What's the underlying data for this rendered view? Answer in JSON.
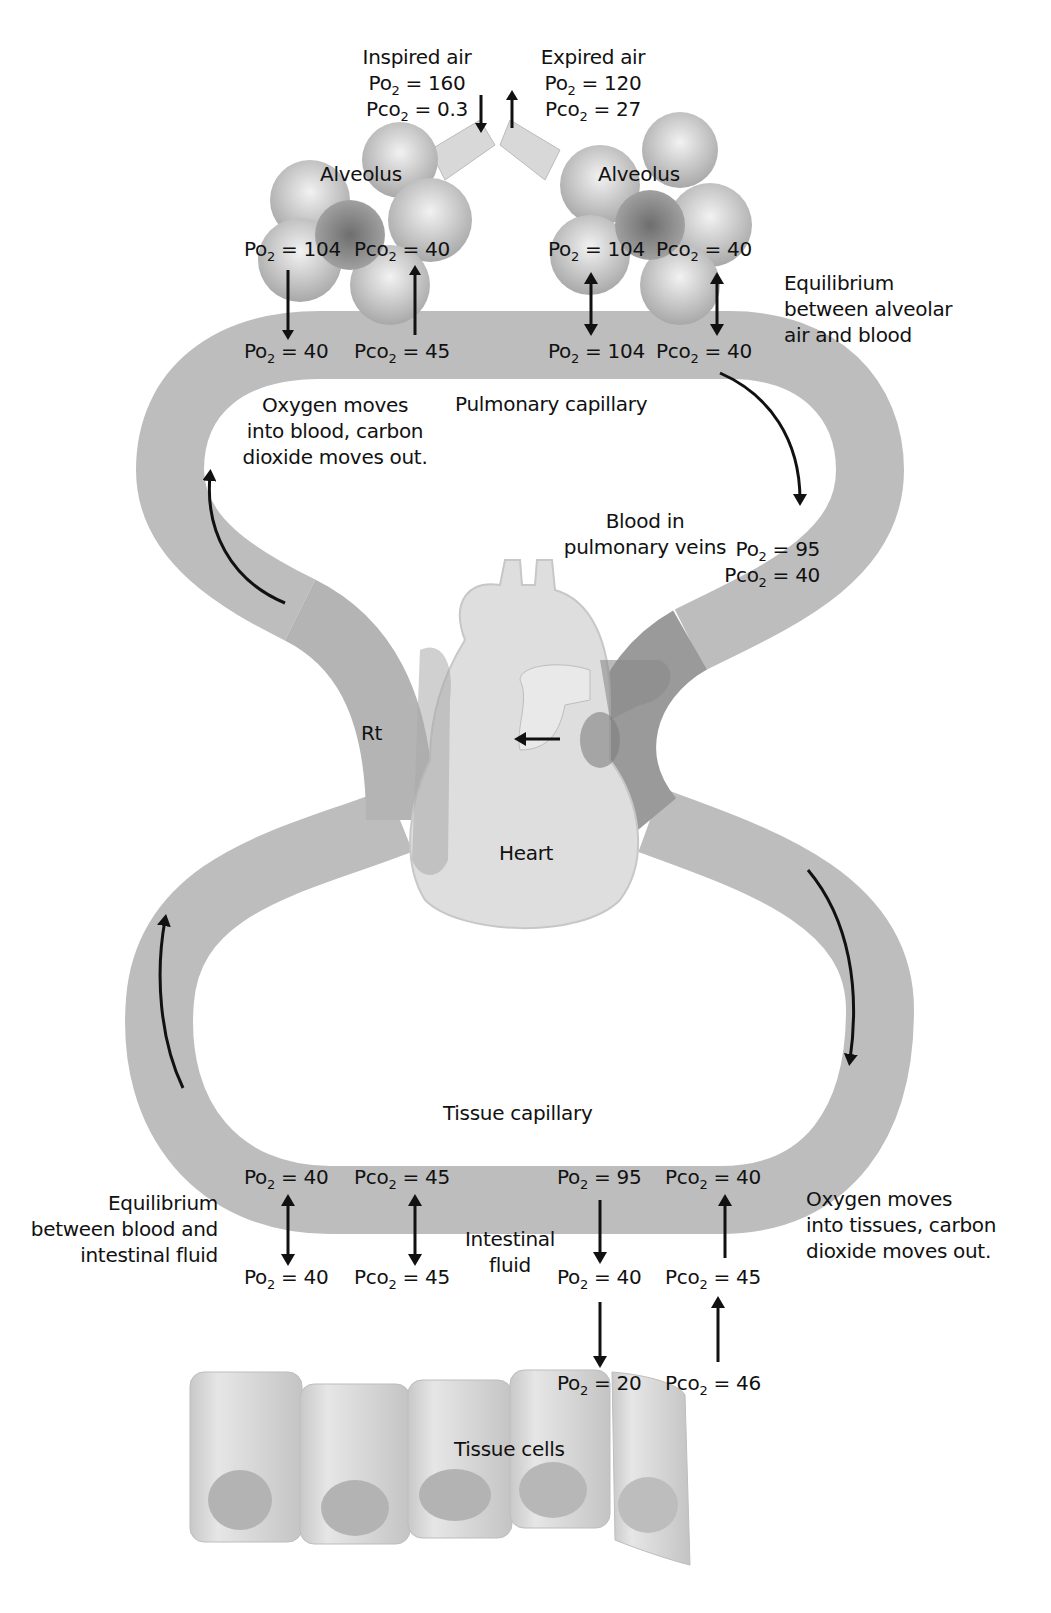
{
  "diagram": {
    "title": "",
    "colors": {
      "vessel": "#b9b9b9",
      "vessel_dark": "#8c8c8c",
      "heart": "#dcdcdc",
      "cells": "#d2d2d2",
      "arrow": "#111111",
      "background": "#ffffff"
    },
    "inspired": {
      "title": "Inspired air",
      "po2": "Po2 = 160",
      "pco2": "Pco2 = 0.3"
    },
    "expired": {
      "title": "Expired air",
      "po2": "Po2 = 120",
      "pco2": "Pco2 = 27"
    },
    "alveolus_left": {
      "label": "Alveolus",
      "po2": "Po2 = 104",
      "pco2": "Pco2 = 40"
    },
    "alveolus_right": {
      "label": "Alveolus",
      "po2": "Po2 = 104",
      "pco2": "Pco2 = 40"
    },
    "pulmonary_left": {
      "po2": "Po2 = 40",
      "pco2": "Pco2 = 45"
    },
    "pulmonary_right": {
      "po2": "Po2 = 104",
      "pco2": "Pco2 = 40"
    },
    "equilibrium_alveolar": [
      "Equilibrium",
      "between alveolar",
      "air and blood"
    ],
    "oxygen_into_blood": [
      "Oxygen moves",
      "into blood, carbon",
      "dioxide moves out."
    ],
    "pulmonary_capillary": "Pulmonary capillary",
    "pulmonary_veins": [
      "Blood in",
      "pulmonary veins"
    ],
    "pulmonary_veins_values": {
      "po2": "Po2 = 95",
      "pco2": "Pco2 = 40"
    },
    "heart": {
      "label": "Heart",
      "side_label": "Rt"
    },
    "tissue_capillary": "Tissue capillary",
    "tissue_cap_left": {
      "po2": "Po2 = 40",
      "pco2": "Pco2 = 45"
    },
    "tissue_cap_right": {
      "po2": "Po2 = 95",
      "pco2": "Pco2 = 40"
    },
    "equilibrium_intestinal": [
      "Equilibrium",
      "between blood and",
      "intestinal fluid"
    ],
    "intestinal_fluid": [
      "Intestinal",
      "fluid"
    ],
    "fluid_left": {
      "po2": "Po2 = 40",
      "pco2": "Pco2 = 45"
    },
    "fluid_right": {
      "po2": "Po2 = 40",
      "pco2": "Pco2 = 45"
    },
    "oxygen_into_tissues": [
      "Oxygen moves",
      "into tissues, carbon",
      "dioxide moves out."
    ],
    "tissue_cells": {
      "label": "Tissue cells",
      "po2": "Po2 = 20",
      "pco2": "Pco2 = 46"
    }
  }
}
